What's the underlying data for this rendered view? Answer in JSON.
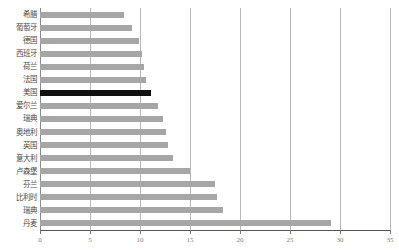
{
  "chart_data": {
    "type": "bar",
    "orientation": "horizontal",
    "title": "",
    "subtitle": "",
    "xlabel": "",
    "ylabel": "",
    "xlim": [
      0,
      35
    ],
    "ylim": null,
    "grid": true,
    "gridlines_axis": "x",
    "legend": null,
    "legend_position": "none",
    "categories": [
      "希腊",
      "葡萄牙",
      "德国",
      "西班牙",
      "荷兰",
      "法国",
      "美国",
      "爱尔兰",
      "瑞典",
      "奥地利",
      "英国",
      "意大利",
      "卢森堡",
      "芬兰",
      "比利时",
      "瑞典",
      "丹麦"
    ],
    "values": [
      8.4,
      9.2,
      9.9,
      10.2,
      10.4,
      10.6,
      11.1,
      11.8,
      12.3,
      12.6,
      12.8,
      13.3,
      15.0,
      17.5,
      17.7,
      18.3,
      29.1
    ],
    "highlight_category": "美国",
    "xticks": [
      0,
      5,
      10,
      15,
      20,
      25,
      30,
      35
    ],
    "xtick_labels": [
      "0",
      "5",
      "10",
      "15",
      "20",
      "25",
      "30",
      "35"
    ],
    "colors": {
      "bar": "#a6a6a6",
      "bar_highlight": "#111111",
      "gridline": "#b9b9b9",
      "axis": "#555555",
      "label_text": "#4c4c4c",
      "tick_text": "#7d7d7d",
      "background": "#ffffff"
    }
  }
}
